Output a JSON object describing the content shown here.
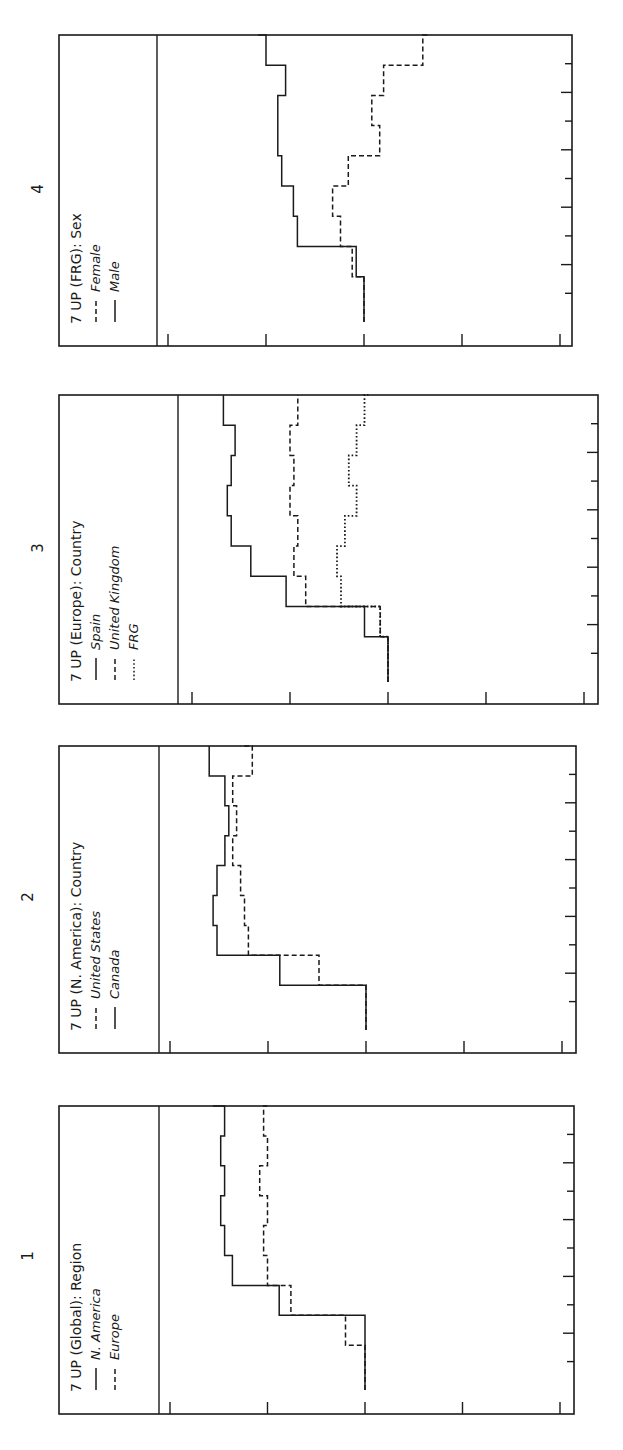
{
  "figure": {
    "panels": [
      {
        "number": "1",
        "title": "7 UP (Global): Region",
        "legend": [
          {
            "label": "N. America",
            "style": "solid"
          },
          {
            "label": "Europe",
            "style": "dashed"
          }
        ]
      },
      {
        "number": "2",
        "title": "7 UP (N. America): Country",
        "legend": [
          {
            "label": "United States",
            "style": "dashed"
          },
          {
            "label": "Canada",
            "style": "solid"
          }
        ]
      },
      {
        "number": "3",
        "title": "7 UP (Europe): Country",
        "legend": [
          {
            "label": "Spain",
            "style": "solid"
          },
          {
            "label": "United Kingdom",
            "style": "dashed"
          },
          {
            "label": "FRG",
            "style": "dotted"
          }
        ]
      },
      {
        "number": "4",
        "title": "7 UP (FRG): Sex",
        "legend": [
          {
            "label": "Female",
            "style": "dashed"
          },
          {
            "label": "Male",
            "style": "solid"
          }
        ]
      }
    ]
  },
  "chart_data": [
    {
      "type": "line",
      "title": "7 UP (Global): Region",
      "panel": "1",
      "orientation": "rotated 90° (time runs bottom-to-top, value runs left-to-right)",
      "xlabel": "",
      "ylabel": "",
      "x_ticks": 9,
      "value_ticks": 5,
      "ylim": [
        0,
        1
      ],
      "grid": false,
      "legend_position": "inside-left",
      "x": [
        0,
        1,
        2,
        3,
        4,
        5,
        6,
        7,
        8,
        9
      ],
      "series": [
        {
          "name": "N. America",
          "style": "solid",
          "values": [
            0.5,
            0.5,
            0.28,
            0.16,
            0.14,
            0.13,
            0.14,
            0.13,
            0.14,
            0.11
          ]
        },
        {
          "name": "Europe",
          "style": "dashed",
          "values": [
            0.5,
            0.45,
            0.31,
            0.25,
            0.24,
            0.25,
            0.23,
            0.25,
            0.24,
            0.25
          ]
        }
      ]
    },
    {
      "type": "line",
      "title": "7 UP (N. America): Country",
      "panel": "2",
      "orientation": "rotated 90°",
      "xlabel": "",
      "ylabel": "",
      "x_ticks": 9,
      "value_ticks": 5,
      "ylim": [
        0,
        1
      ],
      "grid": false,
      "legend_position": "inside-left",
      "x": [
        0,
        1,
        2,
        3,
        4,
        5,
        6,
        7,
        8,
        9
      ],
      "series": [
        {
          "name": "United States",
          "style": "dashed",
          "values": [
            0.5,
            0.38,
            0.2,
            0.19,
            0.18,
            0.16,
            0.17,
            0.16,
            0.21,
            0.18
          ]
        },
        {
          "name": "Canada",
          "style": "solid",
          "values": [
            0.5,
            0.28,
            0.12,
            0.11,
            0.12,
            0.14,
            0.15,
            0.14,
            0.1,
            0.1
          ]
        }
      ]
    },
    {
      "type": "line",
      "title": "7 UP (Europe): Country",
      "panel": "3",
      "orientation": "rotated 90°",
      "xlabel": "",
      "ylabel": "",
      "x_ticks": 9,
      "value_ticks": 5,
      "ylim": [
        0,
        1
      ],
      "grid": false,
      "legend_position": "inside-left",
      "x": [
        0,
        1,
        2,
        3,
        4,
        5,
        6,
        7,
        8,
        9
      ],
      "series": [
        {
          "name": "Spain",
          "style": "solid",
          "values": [
            0.5,
            0.44,
            0.24,
            0.15,
            0.1,
            0.09,
            0.1,
            0.11,
            0.08,
            0.08
          ]
        },
        {
          "name": "United Kingdom",
          "style": "dashed",
          "values": [
            0.5,
            0.48,
            0.29,
            0.26,
            0.27,
            0.25,
            0.26,
            0.25,
            0.27,
            0.27
          ]
        },
        {
          "name": "FRG",
          "style": "dotted",
          "values": [
            0.5,
            0.48,
            0.38,
            0.37,
            0.39,
            0.42,
            0.4,
            0.42,
            0.44,
            0.45
          ]
        }
      ]
    },
    {
      "type": "line",
      "title": "7 UP (FRG): Sex",
      "panel": "4",
      "orientation": "rotated 90°",
      "xlabel": "",
      "ylabel": "",
      "x_ticks": 9,
      "value_ticks": 5,
      "ylim": [
        0,
        1
      ],
      "grid": false,
      "legend_position": "inside-left",
      "x": [
        0,
        1,
        2,
        3,
        4,
        5,
        6,
        7,
        8,
        9
      ],
      "series": [
        {
          "name": "Female",
          "style": "dashed",
          "values": [
            0.5,
            0.47,
            0.44,
            0.42,
            0.46,
            0.54,
            0.52,
            0.55,
            0.65,
            0.67
          ]
        },
        {
          "name": "Male",
          "style": "solid",
          "values": [
            0.5,
            0.48,
            0.33,
            0.32,
            0.29,
            0.28,
            0.28,
            0.3,
            0.25,
            0.23
          ]
        }
      ]
    }
  ]
}
